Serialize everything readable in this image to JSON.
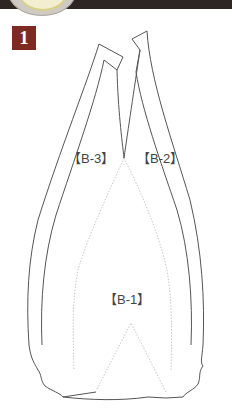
{
  "header": {
    "step_number": "1",
    "bar_color": "#2e2623",
    "step_badge_color": "#7c2a22"
  },
  "diagram": {
    "parts": [
      {
        "id": "B-3",
        "label": "【B-3】"
      },
      {
        "id": "B-2",
        "label": "【B-2】"
      },
      {
        "id": "B-1",
        "label": "【B-1】"
      }
    ],
    "line_color": "#555555",
    "fold_line_color": "#bbbbbb"
  }
}
